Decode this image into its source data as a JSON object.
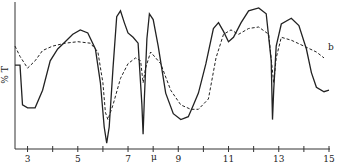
{
  "chart_data": {
    "type": "line",
    "title": "",
    "xlabel": "μ",
    "ylabel": "% T",
    "xlim": [
      2.5,
      15
    ],
    "ylim": [
      0,
      100
    ],
    "grid": false,
    "x_ticks": [
      3,
      4,
      5,
      6,
      7,
      8,
      9,
      10,
      11,
      12,
      13,
      14,
      15
    ],
    "x_tick_labels": [
      "3",
      "5",
      "7",
      "9",
      "11",
      "13",
      "15"
    ],
    "series": [
      {
        "name": "a (solid)",
        "style": "solid",
        "x": [
          2.5,
          2.7,
          2.8,
          3.0,
          3.3,
          3.6,
          3.9,
          4.2,
          4.5,
          4.8,
          5.1,
          5.4,
          5.7,
          5.9,
          6.05,
          6.15,
          6.25,
          6.4,
          6.55,
          6.7,
          6.85,
          7.0,
          7.2,
          7.4,
          7.55,
          7.6,
          7.65,
          7.75,
          7.85,
          8.0,
          8.2,
          8.5,
          8.8,
          9.1,
          9.4,
          9.6,
          9.8,
          10.1,
          10.4,
          10.6,
          10.8,
          11.0,
          11.2,
          11.5,
          11.8,
          12.2,
          12.5,
          12.7,
          12.75,
          12.8,
          12.9,
          13.1,
          13.5,
          13.8,
          14.1,
          14.3,
          14.5,
          14.8,
          15.0
        ],
        "y": [
          57,
          57,
          30,
          28,
          28,
          40,
          60,
          68,
          73,
          78,
          81,
          79,
          68,
          45,
          15,
          4,
          15,
          55,
          90,
          94,
          86,
          79,
          76,
          72,
          30,
          10,
          35,
          75,
          92,
          88,
          70,
          38,
          24,
          20,
          22,
          30,
          38,
          58,
          82,
          86,
          80,
          73,
          76,
          86,
          94,
          96,
          92,
          60,
          20,
          40,
          70,
          85,
          89,
          84,
          68,
          52,
          42,
          39,
          40
        ]
      },
      {
        "name": "b (dashed)",
        "style": "dashed",
        "x": [
          2.5,
          2.7,
          3.0,
          3.3,
          3.6,
          4.0,
          4.5,
          5.0,
          5.5,
          5.8,
          6.0,
          6.1,
          6.2,
          6.4,
          6.7,
          7.0,
          7.3,
          7.5,
          7.6,
          7.7,
          7.9,
          8.3,
          8.7,
          9.1,
          9.5,
          9.8,
          10.2,
          10.5,
          10.8,
          11.1,
          11.4,
          11.8,
          12.2,
          12.6,
          12.8,
          12.9,
          13.1,
          13.5,
          14.0,
          14.5,
          14.8
        ],
        "y": [
          70,
          63,
          55,
          60,
          67,
          70,
          72,
          73,
          72,
          66,
          45,
          25,
          20,
          30,
          48,
          58,
          62,
          60,
          45,
          55,
          66,
          58,
          40,
          30,
          27,
          27,
          34,
          62,
          78,
          81,
          78,
          82,
          83,
          78,
          45,
          62,
          76,
          74,
          70,
          66,
          62
        ]
      }
    ],
    "annotations": [
      {
        "text": "b",
        "x": 14.8,
        "y": 66
      }
    ]
  }
}
